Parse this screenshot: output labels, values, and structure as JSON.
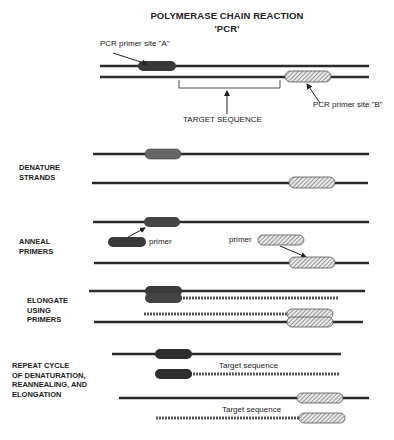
{
  "title": {
    "line1": "POLYMERASE CHAIN REACTION",
    "line2": "'PCR'"
  },
  "labels": {
    "primer_site_a": "PCR primer site \"A\"",
    "primer_site_b": "PCR primer site \"B\"",
    "target_sequence": "TARGET SEQUENCE",
    "primer_left": "primer",
    "primer_right": "primer",
    "target_seq_1": "Target sequence",
    "target_seq_2": "Target sequence"
  },
  "steps": [
    {
      "line1": "DENATURE",
      "line2": "STRANDS"
    },
    {
      "line1": "ANNEAL",
      "line2": "PRIMERS"
    },
    {
      "line1": "ELONGATE",
      "line2": "USING",
      "line3": "PRIMERS"
    },
    {
      "line1": "REPEAT CYCLE",
      "line2": "OF DENATURATION,",
      "line3": "REANNEALING, AND",
      "line4": "ELONGATION"
    }
  ],
  "colors": {
    "strand": "#2a2a2a",
    "primer_a": "#4a4a4a",
    "primer_b_hatch": "#888888",
    "new_strand": "#555555"
  }
}
